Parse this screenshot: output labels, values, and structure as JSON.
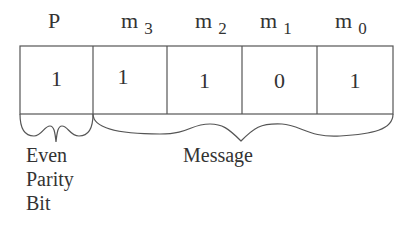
{
  "diagram": {
    "fields": [
      {
        "id": "P",
        "label": "P",
        "subscript": "",
        "value": "1"
      },
      {
        "id": "m3",
        "label": "m",
        "subscript": "3",
        "value": "1"
      },
      {
        "id": "m2",
        "label": "m",
        "subscript": "2",
        "value": "1"
      },
      {
        "id": "m1",
        "label": "m",
        "subscript": "1",
        "value": "0"
      },
      {
        "id": "m0",
        "label": "m",
        "subscript": "0",
        "value": "1"
      }
    ],
    "annotations": {
      "parity": {
        "line1": "Even",
        "line2": "Parity",
        "line3": "Bit"
      },
      "message": "Message"
    },
    "colors": {
      "stroke": "#555555",
      "text": "#333333",
      "background": "#ffffff"
    }
  }
}
